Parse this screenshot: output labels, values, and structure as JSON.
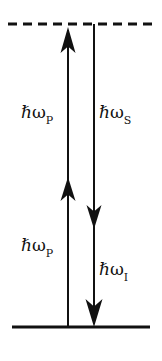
{
  "figure": {
    "name": "energy-level-diagram",
    "background_color": "#ffffff",
    "stroke_color": "#111111",
    "width": 162,
    "height": 361
  },
  "levels": {
    "virtual": {
      "name": "virtual-level",
      "style": "dashed",
      "y": 24,
      "x_start": 8,
      "x_end": 155
    },
    "ground": {
      "name": "ground-level",
      "style": "solid",
      "y": 327,
      "x_start": 12,
      "x_end": 150
    }
  },
  "transitions": [
    {
      "id": "pump-upper",
      "direction": "up",
      "x": 68,
      "y_tail": 327,
      "y_head": 26,
      "arrowhead_y": [
        28,
        52
      ],
      "label": {
        "hbar": "ℏ",
        "omega": "ω",
        "subscript": "P"
      }
    },
    {
      "id": "pump-lower",
      "direction": "up",
      "x": 68,
      "y_tail": 327,
      "y_head": 178,
      "arrowhead_y": [
        178,
        200
      ],
      "label": {
        "hbar": "ℏ",
        "omega": "ω",
        "subscript": "P"
      }
    },
    {
      "id": "stokes",
      "direction": "down",
      "x": 94,
      "y_tail": 24,
      "y_head": 228,
      "arrowhead_y": [
        206,
        228
      ],
      "label": {
        "hbar": "ℏ",
        "omega": "ω",
        "subscript": "S"
      }
    },
    {
      "id": "idler",
      "direction": "down",
      "x": 94,
      "y_tail": 24,
      "y_head": 327,
      "arrowhead_y": [
        300,
        326
      ],
      "label": {
        "hbar": "ℏ",
        "omega": "ω",
        "subscript": "I"
      }
    }
  ],
  "labels": {
    "pump_upper": {
      "hbar": "ℏ",
      "omega": "ω",
      "subscript": "P"
    },
    "stokes": {
      "hbar": "ℏ",
      "omega": "ω",
      "subscript": "S"
    },
    "pump_lower": {
      "hbar": "ℏ",
      "omega": "ω",
      "subscript": "P"
    },
    "idler": {
      "hbar": "ℏ",
      "omega": "ω",
      "subscript": "I"
    }
  }
}
